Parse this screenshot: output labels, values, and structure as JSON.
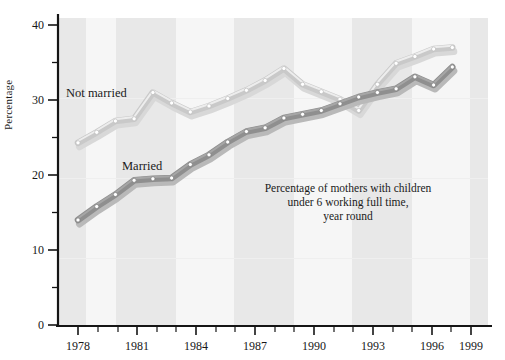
{
  "chart_data": {
    "type": "line",
    "title": "",
    "annotation": [
      "Percentage of mothers with children",
      "under 6 working full time,",
      "year round"
    ],
    "xlabel": "",
    "ylabel": "Percentage",
    "xlim": [
      1978,
      1999
    ],
    "ylim": [
      0,
      40
    ],
    "xticks": [
      1978,
      1981,
      1984,
      1987,
      1990,
      1993,
      1996,
      1999
    ],
    "xticklabels": [
      "1978",
      "1981",
      "1984",
      "1987",
      "1990",
      "1993",
      "1996",
      "1999"
    ],
    "yticks": [
      0,
      10,
      20,
      30,
      40
    ],
    "yticklabels": [
      "0",
      "10",
      "20",
      "30",
      "40"
    ],
    "yminorticks": [
      5,
      15,
      25,
      35
    ],
    "grid": false,
    "background_bands": true,
    "legend": "inline-labels",
    "x": [
      1978,
      1979,
      1980,
      1981,
      1982,
      1983,
      1984,
      1985,
      1986,
      1987,
      1988,
      1989,
      1990,
      1991,
      1992,
      1993,
      1994,
      1995,
      1996,
      1997,
      1998
    ],
    "series": [
      {
        "name": "Not married",
        "label": "Not married",
        "color": "#c9c9c9",
        "marker": "circle",
        "values": [
          24.3,
          25.7,
          27.2,
          27.5,
          31.0,
          29.6,
          28.4,
          29.2,
          30.2,
          31.3,
          32.6,
          34.2,
          32.1,
          31.1,
          30.1,
          28.6,
          32.1,
          34.9,
          35.8,
          36.8,
          37.0
        ]
      },
      {
        "name": "Married",
        "label": "Married",
        "color": "#8f8f8f",
        "marker": "circle",
        "values": [
          14.0,
          15.8,
          17.4,
          19.3,
          19.5,
          19.6,
          21.4,
          22.7,
          24.4,
          25.8,
          26.3,
          27.6,
          28.1,
          28.6,
          29.5,
          30.4,
          31.0,
          31.5,
          33.1,
          32.0,
          34.4
        ]
      }
    ]
  },
  "labels": {
    "not_married": "Not married",
    "married": "Married",
    "y_axis": "Percentage",
    "annot_line1": "Percentage of mothers with children",
    "annot_line2": "under 6 working full time,",
    "annot_line3": "year round"
  },
  "colors": {
    "light_line": "#c9c9c9",
    "dark_line": "#8e8e8e",
    "axis": "#151515",
    "band_a": "#e9e9e9",
    "band_b": "#f4f4f4",
    "page": "#ffffff"
  }
}
